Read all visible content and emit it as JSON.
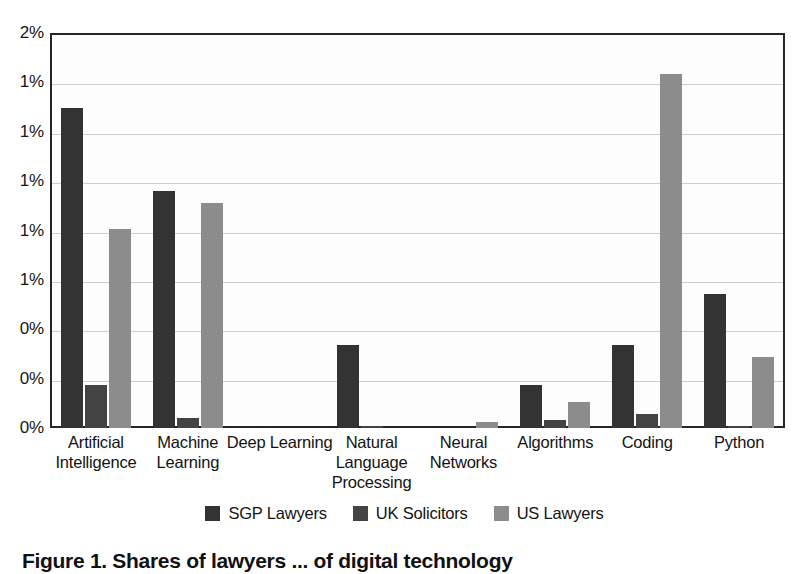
{
  "chart_data": {
    "type": "bar",
    "title": "",
    "subtitle": "",
    "xlabel": "",
    "ylabel": "",
    "ylim": [
      0,
      2.0
    ],
    "grid": true,
    "legend_position": "bottom",
    "y_ticks": [
      {
        "value": 2.0,
        "label": "2%"
      },
      {
        "value": 1.75,
        "label": "1%"
      },
      {
        "value": 1.5,
        "label": "1%"
      },
      {
        "value": 1.25,
        "label": "1%"
      },
      {
        "value": 1.0,
        "label": "1%"
      },
      {
        "value": 0.75,
        "label": "1%"
      },
      {
        "value": 0.5,
        "label": "0%"
      },
      {
        "value": 0.25,
        "label": "0%"
      },
      {
        "value": 0.0,
        "label": "0%"
      }
    ],
    "categories": [
      "Artificial Intelligence",
      "Machine Learning",
      "Deep Learning",
      "Natural Language Processing",
      "Neural Networks",
      "Algorithms",
      "Coding",
      "Python"
    ],
    "category_lines": [
      [
        "Artificial",
        "Intelligence"
      ],
      [
        "Machine",
        "Learning"
      ],
      [
        "Deep Learning"
      ],
      [
        "Natural",
        "Language",
        "Processing"
      ],
      [
        "Neural",
        "Networks"
      ],
      [
        "Algorithms"
      ],
      [
        "Coding"
      ],
      [
        "Python"
      ]
    ],
    "series": [
      {
        "name": "SGP Lawyers",
        "color": "#333333",
        "values": [
          1.62,
          1.2,
          0.0,
          0.42,
          0.0,
          0.22,
          0.42,
          0.68
        ]
      },
      {
        "name": "UK Solicitors",
        "color": "#434343",
        "values": [
          0.22,
          0.05,
          0.0,
          0.01,
          0.0,
          0.04,
          0.07,
          0.01
        ]
      },
      {
        "name": "US Lawyers",
        "color": "#8c8c8c",
        "values": [
          1.01,
          1.14,
          0.0,
          0.0,
          0.03,
          0.13,
          1.79,
          0.36
        ]
      }
    ]
  },
  "legend": {
    "items": [
      {
        "label": "SGP Lawyers",
        "color": "#333333"
      },
      {
        "label": "UK Solicitors",
        "color": "#434343"
      },
      {
        "label": "US Lawyers",
        "color": "#8c8c8c"
      }
    ]
  },
  "caption": {
    "text": "Figure 1. Shares of lawyers ... of digital technology"
  }
}
